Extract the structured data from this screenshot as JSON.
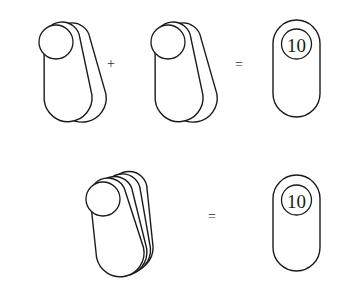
{
  "diagram": {
    "row1": {
      "operand_left": {
        "label": "double-tag",
        "count": 2
      },
      "operator_plus": "+",
      "operand_right": {
        "label": "double-tag",
        "count": 2
      },
      "operator_equals": "=",
      "result": {
        "label": "10"
      }
    },
    "row2": {
      "operand": {
        "label": "stacked-tags",
        "count": 4
      },
      "operator_equals": "=",
      "result": {
        "label": "10"
      }
    },
    "colors": {
      "stroke": "#1a1a1a",
      "background": "#ffffff"
    }
  }
}
